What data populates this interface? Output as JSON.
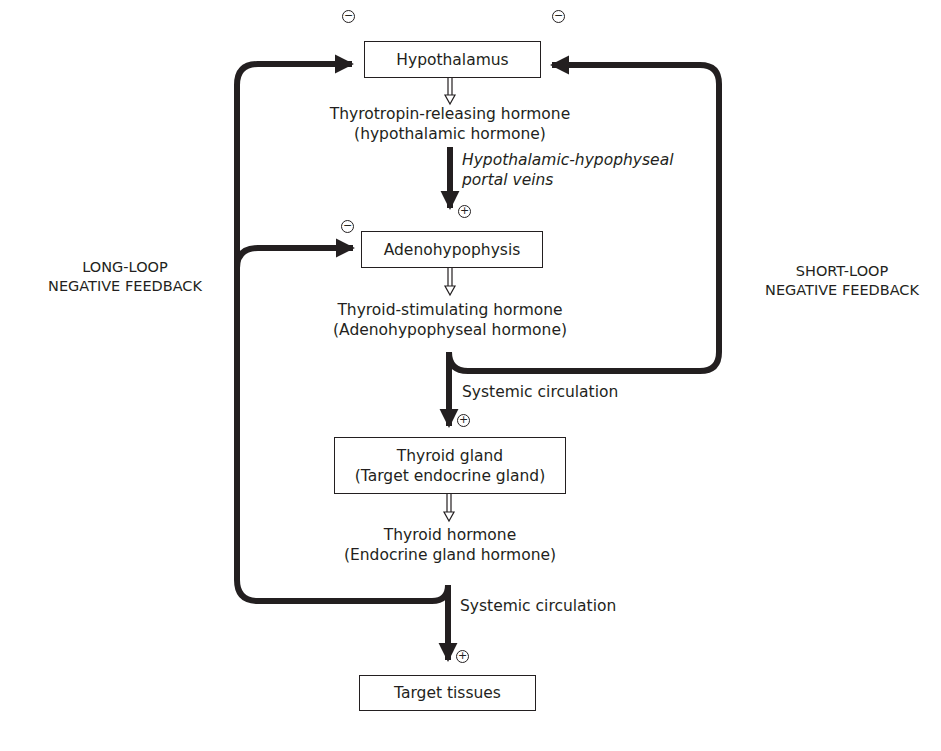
{
  "nodes": {
    "hypothalamus": {
      "label": "Hypothalamus"
    },
    "trh": {
      "line1": "Thyrotropin-releasing hormone",
      "line2": "(hypothalamic hormone)"
    },
    "portal": {
      "line1": "Hypothalamic-hypophyseal",
      "line2": "portal veins"
    },
    "adenohypophysis": {
      "label": "Adenohypophysis"
    },
    "tsh": {
      "line1": "Thyroid-stimulating hormone",
      "line2": "(Adenohypophyseal hormone)"
    },
    "systemic1": {
      "label": "Systemic circulation"
    },
    "thyroid_gland": {
      "line1": "Thyroid gland",
      "line2": "(Target endocrine gland)"
    },
    "thyroid_hormone": {
      "line1": "Thyroid hormone",
      "line2": "(Endocrine gland hormone)"
    },
    "systemic2": {
      "label": "Systemic circulation"
    },
    "target_tissues": {
      "label": "Target tissues"
    }
  },
  "loops": {
    "long": {
      "line1": "LONG-LOOP",
      "line2": "NEGATIVE FEEDBACK"
    },
    "short": {
      "line1": "SHORT-LOOP",
      "line2": "NEGATIVE FEEDBACK"
    }
  },
  "signs": {
    "minus": "−",
    "plus": "+"
  },
  "colors": {
    "ink": "#231f20",
    "background": "#ffffff"
  }
}
